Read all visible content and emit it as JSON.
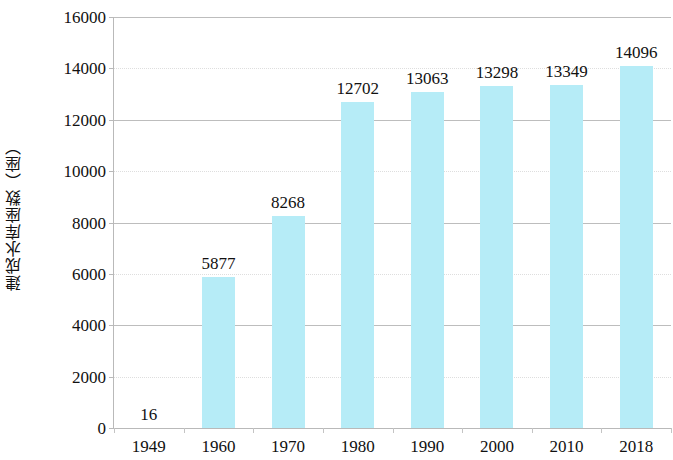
{
  "chart_data": {
    "type": "bar",
    "title": "",
    "subtitle": "",
    "xlabel": "",
    "ylabel": "建成水库座数（座）",
    "categories": [
      "1949",
      "1960",
      "1970",
      "1980",
      "1990",
      "2000",
      "2010",
      "2018"
    ],
    "values": [
      16,
      5877,
      8268,
      12702,
      13063,
      13298,
      13349,
      14096
    ],
    "value_labels": [
      "16",
      "5877",
      "8268",
      "12702",
      "13063",
      "13298",
      "13349",
      "14096"
    ],
    "ylim": [
      0,
      16000
    ],
    "yticks": [
      0,
      2000,
      4000,
      6000,
      8000,
      10000,
      12000,
      14000,
      16000
    ],
    "ytick_labels": [
      "0",
      "2000",
      "4000",
      "6000",
      "8000",
      "10000",
      "12000",
      "14000",
      "16000"
    ],
    "grid": true,
    "legend": false,
    "legend_position": "none",
    "bar_color": "#b6ecf7",
    "axis_color": "#b9b9b9",
    "gridline_color": "#bdbdbd",
    "text_color": "#111111",
    "background_color": "#ffffff"
  }
}
